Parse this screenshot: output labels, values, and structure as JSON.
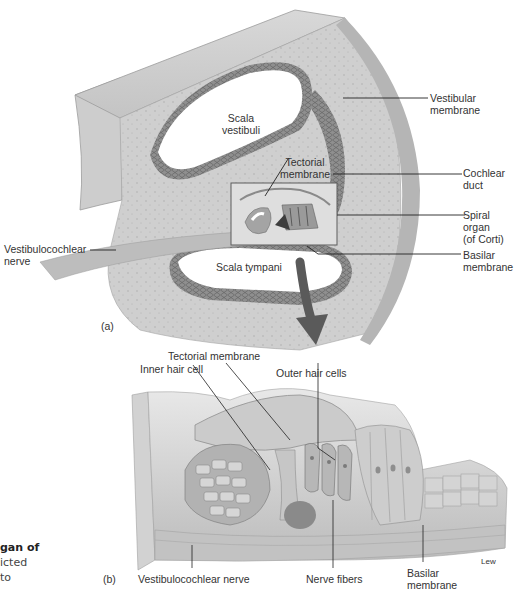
{
  "figure": {
    "panel_a": {
      "panel_label": "(a)",
      "labels": {
        "scala_vestibuli": "Scala\nvestibuli",
        "vestibular_membrane": "Vestibular\nmembrane",
        "tectorial_membrane": "Tectorial\nmembrane",
        "cochlear_duct": "Cochlear\nduct",
        "spiral_organ": "Spiral organ\n(of Corti)",
        "basilar_membrane": "Basilar\nmembrane",
        "vestibulocochlear_nerve": "Vestibulocochlear\nnerve",
        "scala_tympani": "Scala tympani"
      }
    },
    "panel_b": {
      "panel_label": "(b)",
      "labels": {
        "tectorial_membrane": "Tectorial membrane",
        "inner_hair_cell": "Inner hair cell",
        "outer_hair_cells": "Outer hair cells",
        "vestibulocochlear_nerve": "Vestibulocochlear nerve",
        "nerve_fibers": "Nerve fibers",
        "basilar_membrane": "Basilar\nmembrane"
      },
      "artist_signature": "Lew"
    },
    "caption_fragment": {
      "line1": "gan of",
      "line2": "icted",
      "line3": "to"
    },
    "colors": {
      "bone": "#c9c9c9",
      "bone_light": "#e3e3e3",
      "membrane_dark": "#7d7d7d",
      "arrow": "#5a5a5a",
      "leader_line": "#222222"
    }
  }
}
